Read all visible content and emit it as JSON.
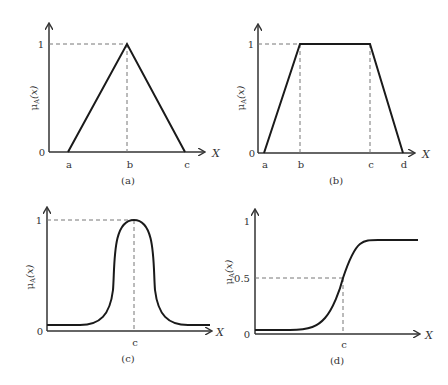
{
  "panels": [
    {
      "id": "a",
      "caption": "(a)",
      "shape": "triangular",
      "y_label": "μA(x)",
      "x_label": "X",
      "y_ticks": [
        "0",
        "1"
      ],
      "x_ticks": [
        "a",
        "b",
        "c"
      ]
    },
    {
      "id": "b",
      "caption": "(b)",
      "shape": "trapezoidal",
      "y_label": "μA(x)",
      "x_label": "X",
      "y_ticks": [
        "0",
        "1"
      ],
      "x_ticks": [
        "a",
        "b",
        "c",
        "d"
      ]
    },
    {
      "id": "c",
      "caption": "(c)",
      "shape": "gaussian/bell",
      "y_label": "μA(x)",
      "x_label": "X",
      "y_ticks": [
        "0",
        "1"
      ],
      "x_ticks": [
        "c"
      ]
    },
    {
      "id": "d",
      "caption": "(d)",
      "shape": "sigmoidal",
      "y_label": "μA(x)",
      "x_label": "X",
      "y_ticks": [
        "0",
        "0.5",
        "1"
      ],
      "x_ticks": [
        "c"
      ]
    }
  ],
  "labels": {
    "mu": "μ",
    "sub": "A",
    "arg": "(x)"
  }
}
